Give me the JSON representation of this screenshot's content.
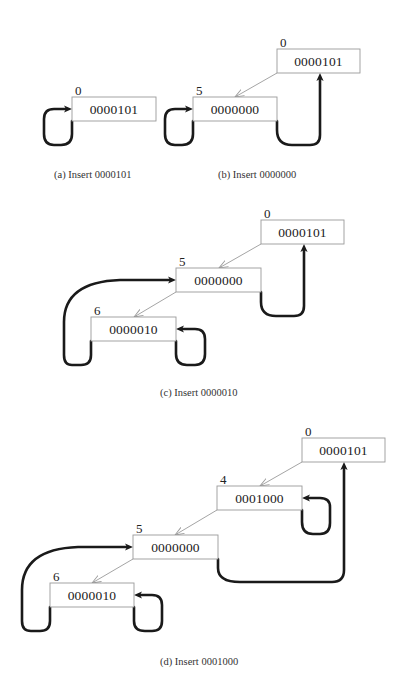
{
  "colors": {
    "background": "#ffffff",
    "box_stroke": "#9a9a9a",
    "thin_edge": "#9a9a9a",
    "thick_edge": "#1a1a1a",
    "text": "#222222"
  },
  "subfigures": [
    {
      "id": "a",
      "caption": "(a) Insert 0000101",
      "caption_pos": [
        54,
        178
      ],
      "nodes": [
        {
          "index": "0",
          "key": "0000101",
          "box": [
            72,
            97,
            84,
            24
          ]
        }
      ],
      "thin_edges": [],
      "thick_edges": [
        {
          "d": "M72 121 L72 134 Q72 145 61 145 L54 145 Q44 145 44 134 L44 119 Q44 109 54 109 L67 109"
        }
      ],
      "thick_heads": [
        {
          "tip": [
            72,
            109
          ],
          "dir": "right"
        }
      ]
    },
    {
      "id": "b",
      "caption": "(b) Insert 0000000",
      "caption_pos": [
        218,
        178
      ],
      "nodes": [
        {
          "index": "0",
          "key": "0000101",
          "box": [
            277,
            49,
            83,
            24
          ]
        },
        {
          "index": "5",
          "key": "0000000",
          "box": [
            193,
            97,
            84,
            24
          ]
        }
      ],
      "thin_edges": [
        {
          "from": [
            277,
            73
          ],
          "to": [
            235,
            97
          ]
        }
      ],
      "thick_edges": [
        {
          "d": "M193 121 L193 134 Q193 145 182 145 L175 145 Q165 145 165 134 L165 119 Q165 109 175 109 L188 109"
        },
        {
          "d": "M277 121 L277 130 Q277 145 292 145 L310 145 Q320 145 320 135 L320 80"
        }
      ],
      "thick_heads": [
        {
          "tip": [
            193,
            109
          ],
          "dir": "right"
        },
        {
          "tip": [
            320,
            73
          ],
          "dir": "up"
        }
      ]
    },
    {
      "id": "c",
      "caption": "(c) Insert 0000010",
      "caption_pos": [
        160,
        396
      ],
      "nodes": [
        {
          "index": "0",
          "key": "0000101",
          "box": [
            261,
            220,
            83,
            24
          ]
        },
        {
          "index": "5",
          "key": "0000000",
          "box": [
            176,
            268,
            85,
            24
          ]
        },
        {
          "index": "6",
          "key": "0000010",
          "box": [
            91,
            317,
            85,
            24
          ]
        }
      ],
      "thin_edges": [
        {
          "from": [
            261,
            244
          ],
          "to": [
            219,
            268
          ]
        },
        {
          "from": [
            176,
            292
          ],
          "to": [
            134,
            317
          ]
        }
      ],
      "thick_edges": [
        {
          "d": "M261 292 L261 302 Q261 316 276 316 L294 316 Q304 316 304 306 L304 251"
        },
        {
          "d": "M176 341 L176 354 Q176 365 187 365 L195 365 Q205 365 205 354 L205 339 Q205 329 195 329 L181 329"
        },
        {
          "d": "M91 341 L91 355 Q91 365 81 365 L72 365 Q64 365 64 355 L64 322 Q64 282 120 280 L170 280"
        }
      ],
      "thick_heads": [
        {
          "tip": [
            304,
            244
          ],
          "dir": "up"
        },
        {
          "tip": [
            176,
            329
          ],
          "dir": "left"
        },
        {
          "tip": [
            176,
            280
          ],
          "dir": "right"
        }
      ]
    },
    {
      "id": "d",
      "caption": "(d) Insert 0001000",
      "caption_pos": [
        160,
        665
      ],
      "nodes": [
        {
          "index": "0",
          "key": "0000101",
          "box": [
            302,
            438,
            83,
            24
          ]
        },
        {
          "index": "4",
          "key": "0001000",
          "box": [
            217,
            486,
            85,
            24
          ]
        },
        {
          "index": "5",
          "key": "0000000",
          "box": [
            133,
            535,
            85,
            24
          ]
        },
        {
          "index": "6",
          "key": "0000010",
          "box": [
            50,
            583,
            84,
            24
          ]
        }
      ],
      "thin_edges": [
        {
          "from": [
            302,
            462
          ],
          "to": [
            260,
            486
          ]
        },
        {
          "from": [
            217,
            510
          ],
          "to": [
            175,
            535
          ]
        },
        {
          "from": [
            133,
            559
          ],
          "to": [
            92,
            583
          ]
        }
      ],
      "thick_edges": [
        {
          "d": "M302 510 L302 522 Q302 534 313 534 L320 534 Q330 534 330 523 L330 507 Q330 498 320 498 L307 498"
        },
        {
          "d": "M218 559 L218 568 Q218 582 240 582 L332 582 Q344 582 344 570 L344 469"
        },
        {
          "d": "M134 607 L134 621 Q134 631 145 631 L152 631 Q162 631 162 621 L162 605 Q162 595 152 595 L139 595"
        },
        {
          "d": "M50 607 L50 621 Q50 631 40 631 L31 631 Q22 631 22 621 L22 590 Q22 549 78 547 L127 547"
        }
      ],
      "thick_heads": [
        {
          "tip": [
            302,
            498
          ],
          "dir": "left"
        },
        {
          "tip": [
            344,
            462
          ],
          "dir": "up"
        },
        {
          "tip": [
            134,
            595
          ],
          "dir": "left"
        },
        {
          "tip": [
            133,
            547
          ],
          "dir": "right"
        }
      ]
    }
  ]
}
